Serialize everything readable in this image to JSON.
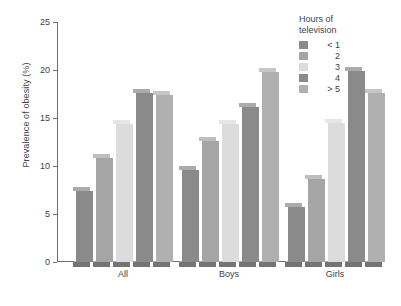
{
  "chart_data": {
    "type": "bar",
    "title": "",
    "subtitle": "",
    "xlabel": "",
    "ylabel": "Prevalence of obesity (%)",
    "categories": [
      "All",
      "Boys",
      "Girls"
    ],
    "ylim": [
      0,
      25
    ],
    "yticks": [
      0,
      5,
      10,
      15,
      20,
      25
    ],
    "ytick_labels": [
      "0",
      "5",
      "10",
      "15",
      "20",
      "25"
    ],
    "grid": false,
    "legend_position": "top-right",
    "legend_title": "Hours of television",
    "series": [
      {
        "name": "< 1",
        "color": "#8a8a8a",
        "values": [
          7.8,
          10.0,
          6.1
        ]
      },
      {
        "name": "2",
        "color": "#a5a5a5",
        "values": [
          11.2,
          13.0,
          9.1
        ]
      },
      {
        "name": "3",
        "color": "#dcdcdc",
        "values": [
          14.8,
          14.8,
          14.9
        ]
      },
      {
        "name": "4",
        "color": "#8a8a8a",
        "values": [
          18.0,
          16.6,
          20.3
        ]
      },
      {
        "name": "> 5",
        "color": "#b0b0b0",
        "values": [
          17.8,
          20.2,
          18.0
        ]
      }
    ],
    "annotations": []
  },
  "axis": {
    "y_label": "Prevalence of obesity (%)"
  },
  "legend": {
    "title_line1": "Hours of",
    "title_line2": "television",
    "items": [
      {
        "label": "< 1"
      },
      {
        "label": "2"
      },
      {
        "label": "3"
      },
      {
        "label": "4"
      },
      {
        "label": "> 5"
      }
    ]
  }
}
